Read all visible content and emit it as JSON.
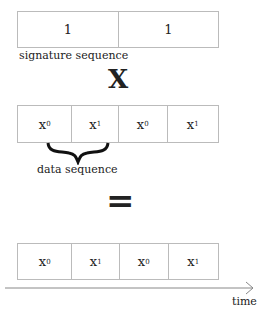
{
  "signature": {
    "cells": [
      "1",
      "1"
    ],
    "label": "signature sequence"
  },
  "operator_multiply": "X",
  "data": {
    "cells": [
      {
        "base": "x",
        "sub": "0"
      },
      {
        "base": "x",
        "sub": "1"
      },
      {
        "base": "x",
        "sub": "0"
      },
      {
        "base": "x",
        "sub": "1"
      }
    ],
    "label": "data sequence"
  },
  "operator_equals": "=",
  "result": {
    "cells": [
      {
        "base": "x",
        "sub": "0"
      },
      {
        "base": "x",
        "sub": "1"
      },
      {
        "base": "x",
        "sub": "0"
      },
      {
        "base": "x",
        "sub": "1"
      }
    ]
  },
  "axis": {
    "label": "time"
  }
}
